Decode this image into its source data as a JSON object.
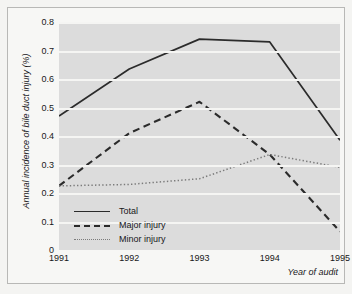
{
  "chart_data": {
    "type": "line",
    "title": "",
    "xlabel": "Year of audit",
    "ylabel": "Annual incidence of bile duct injury (%)",
    "categories": [
      "1991",
      "1992",
      "1993",
      "1994",
      "1995"
    ],
    "x": [
      1991,
      1992,
      1993,
      1994,
      1995
    ],
    "xlim": [
      1991,
      1995
    ],
    "ylim": [
      0,
      0.8
    ],
    "yticks": [
      "0",
      "0.1",
      "0.2",
      "0.3",
      "0.4",
      "0.5",
      "0.6",
      "0.7",
      "0.8"
    ],
    "ytick_values": [
      0,
      0.1,
      0.2,
      0.3,
      0.4,
      0.5,
      0.6,
      0.7,
      0.8
    ],
    "grid": "horizontal",
    "legend_position": "inside-bottom-left",
    "plot_background": "#dcdcdc",
    "gridline_color": "#f5f5f3",
    "series": [
      {
        "name": "Total",
        "style": "solid",
        "color": "#2b2b2b",
        "values": [
          0.47,
          0.635,
          0.74,
          0.73,
          0.385
        ]
      },
      {
        "name": "Major injury",
        "style": "dashed",
        "color": "#2b2b2b",
        "values": [
          0.225,
          0.41,
          0.52,
          0.335,
          0.065
        ]
      },
      {
        "name": "Minor injury",
        "style": "dotted",
        "color": "#7b7b7b",
        "values": [
          0.225,
          0.23,
          0.25,
          0.335,
          0.29
        ]
      }
    ]
  }
}
